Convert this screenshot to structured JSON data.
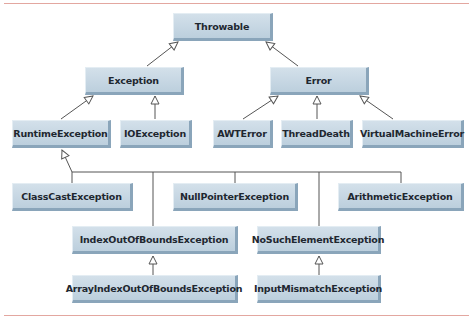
{
  "diagram": {
    "title": "",
    "nodes": [
      {
        "id": "throwable",
        "label": "Throwable",
        "x": 173,
        "y": 13,
        "w": 100,
        "h": 28
      },
      {
        "id": "exception",
        "label": "Exception",
        "x": 85,
        "y": 67,
        "w": 99,
        "h": 28
      },
      {
        "id": "error",
        "label": "Error",
        "x": 270,
        "y": 67,
        "w": 99,
        "h": 28
      },
      {
        "id": "runtime",
        "label": "RuntimeException",
        "x": 12,
        "y": 120,
        "w": 99,
        "h": 28
      },
      {
        "id": "ioexception",
        "label": "IOException",
        "x": 120,
        "y": 120,
        "w": 72,
        "h": 28
      },
      {
        "id": "awterror",
        "label": "AWTError",
        "x": 213,
        "y": 120,
        "w": 60,
        "h": 28
      },
      {
        "id": "threaddeath",
        "label": "ThreadDeath",
        "x": 281,
        "y": 120,
        "w": 72,
        "h": 28
      },
      {
        "id": "vmerror",
        "label": "VirtualMachineError",
        "x": 362,
        "y": 120,
        "w": 102,
        "h": 28
      },
      {
        "id": "classcast",
        "label": "ClassCastException",
        "x": 12,
        "y": 183,
        "w": 121,
        "h": 28
      },
      {
        "id": "nullpointer",
        "label": "NullPointerException",
        "x": 173,
        "y": 183,
        "w": 125,
        "h": 28
      },
      {
        "id": "arithmetic",
        "label": "ArithmeticException",
        "x": 338,
        "y": 183,
        "w": 126,
        "h": 28
      },
      {
        "id": "indexoob",
        "label": "IndexOutOfBoundsException",
        "x": 72,
        "y": 226,
        "w": 166,
        "h": 28
      },
      {
        "id": "nosuchelement",
        "label": "NoSuchElementException",
        "x": 257,
        "y": 226,
        "w": 124,
        "h": 28
      },
      {
        "id": "arrayindexoob",
        "label": "ArrayIndexOutOfBoundsException",
        "x": 72,
        "y": 275,
        "w": 166,
        "h": 28
      },
      {
        "id": "inputmismatch",
        "label": "InputMismatchException",
        "x": 257,
        "y": 275,
        "w": 124,
        "h": 28
      }
    ],
    "edges": [
      {
        "from": "exception",
        "to": "throwable"
      },
      {
        "from": "error",
        "to": "throwable"
      },
      {
        "from": "runtime",
        "to": "exception"
      },
      {
        "from": "ioexception",
        "to": "exception"
      },
      {
        "from": "awterror",
        "to": "error"
      },
      {
        "from": "threaddeath",
        "to": "error"
      },
      {
        "from": "vmerror",
        "to": "error"
      },
      {
        "from": "classcast",
        "to": "runtime"
      },
      {
        "from": "nullpointer",
        "to": "runtime"
      },
      {
        "from": "arithmetic",
        "to": "runtime"
      },
      {
        "from": "indexoob",
        "to": "runtime"
      },
      {
        "from": "nosuchelement",
        "to": "runtime"
      },
      {
        "from": "arrayindexoob",
        "to": "indexoob"
      },
      {
        "from": "inputmismatch",
        "to": "nosuchelement"
      }
    ]
  },
  "colors": {
    "rule": "#e3a7a0",
    "node_fill": "#c8d8e4",
    "node_shadow": "#8aa5ba",
    "edge": "#555555"
  }
}
